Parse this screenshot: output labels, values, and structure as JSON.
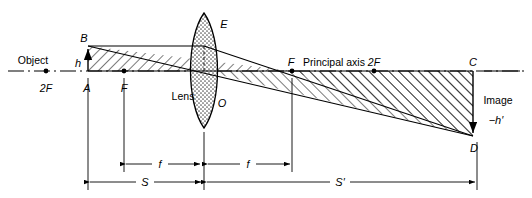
{
  "diagram": {
    "axis_label": "Principal axis",
    "lens_label": "Lens",
    "object_label": "Object",
    "image_label": "Image",
    "object_height_label": "h",
    "image_height_label": "−h′",
    "points": {
      "B": "B",
      "A": "A",
      "E": "E",
      "O": "O",
      "C": "C",
      "D": "D",
      "focal_left": "F",
      "focal_right": "F",
      "two_f_left": "2F",
      "two_f_right": "2F"
    },
    "dimensions": {
      "focal_left_label": "f",
      "focal_right_label": "f",
      "object_distance_label": "S",
      "image_distance_label": "S′"
    },
    "colors": {
      "stroke": "#000000",
      "background": "#ffffff",
      "hatch": "#000000",
      "lens_fill": "#d9d9d9"
    },
    "geometry": {
      "axis_y": 71,
      "object_x": 88,
      "object_top_y": 46,
      "lens_center_x": 204,
      "lens_top_y": 13,
      "lens_bottom_y": 128,
      "focal_left_x": 124,
      "focal_right_x": 292,
      "two_f_left_x": 46,
      "two_f_right_x": 374,
      "image_x": 473,
      "image_bottom_y": 136,
      "dim_f_y": 164,
      "dim_s_y": 182
    }
  }
}
